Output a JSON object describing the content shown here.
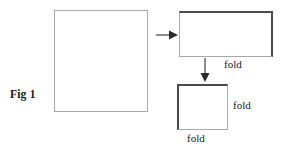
{
  "figure": {
    "caption": "Fig 1",
    "background_color": "#ffffff",
    "edge_light_color": "#a8a8a8",
    "edge_dark_color": "#4a4a4a",
    "arrow_color": "#2b2b2b",
    "text_color": "#1a1a1a"
  },
  "sheets": [
    {
      "name": "unfolded-sheet",
      "description": "full square sheet of paper",
      "x": 54,
      "y": 10,
      "width": 94,
      "height": 102
    },
    {
      "name": "once-folded-sheet",
      "description": "sheet folded in half, landscape rectangle",
      "x": 179,
      "y": 11,
      "width": 94,
      "height": 46
    },
    {
      "name": "twice-folded-sheet",
      "description": "sheet folded twice, small square",
      "x": 177,
      "y": 84,
      "width": 51,
      "height": 46
    }
  ],
  "arrows": [
    {
      "name": "arrow-right",
      "direction": "right"
    },
    {
      "name": "arrow-down",
      "direction": "down"
    }
  ],
  "labels": {
    "fold_1": "fold",
    "fold_2": "fold",
    "fold_3": "fold"
  }
}
